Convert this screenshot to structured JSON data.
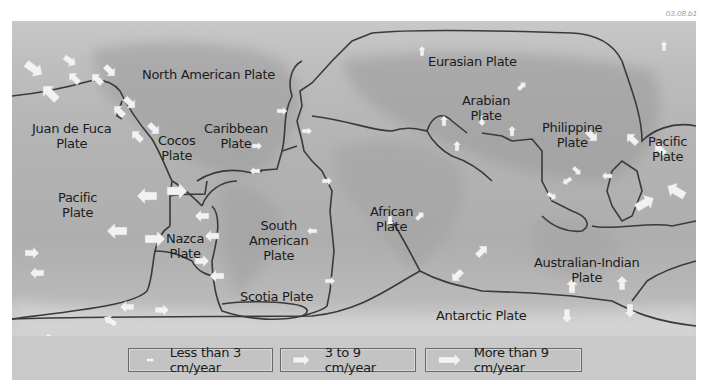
{
  "figure_code": "03.08.b1",
  "plates": [
    {
      "name": "north-american",
      "label": "North American Plate"
    },
    {
      "name": "eurasian",
      "label": "Eurasian Plate"
    },
    {
      "name": "arabian",
      "label": "Arabian Plate"
    },
    {
      "name": "juan-de-fuca",
      "label": "Juan de Fuca Plate"
    },
    {
      "name": "cocos",
      "label": "Cocos Plate"
    },
    {
      "name": "caribbean",
      "label": "Caribbean Plate"
    },
    {
      "name": "philippine",
      "label": "Philippine Plate"
    },
    {
      "name": "pacific-east",
      "label": "Pacific Plate"
    },
    {
      "name": "pacific-west",
      "label": "Pacific Plate"
    },
    {
      "name": "african",
      "label": "African Plate"
    },
    {
      "name": "nazca",
      "label": "Nazca Plate"
    },
    {
      "name": "south-american",
      "label": "South American Plate"
    },
    {
      "name": "australian-indian",
      "label": "Australian-Indian Plate"
    },
    {
      "name": "scotia",
      "label": "Scotia Plate"
    },
    {
      "name": "antarctic",
      "label": "Antarctic Plate"
    }
  ],
  "labels": {
    "north_american": "North American Plate",
    "eurasian": "Eurasian Plate",
    "arabian_1": "Arabian",
    "arabian_2": "Plate",
    "juan_1": "Juan de Fuca",
    "juan_2": "Plate",
    "cocos_1": "Cocos",
    "cocos_2": "Plate",
    "caribbean_1": "Caribbean",
    "caribbean_2": "Plate",
    "philippine_1": "Philippine",
    "philippine_2": "Plate",
    "pacific_e_1": "Pacific",
    "pacific_e_2": "Plate",
    "pacific_w_1": "Pacific",
    "pacific_w_2": "Plate",
    "african_1": "African",
    "african_2": "Plate",
    "nazca_1": "Nazca",
    "nazca_2": "Plate",
    "south_american_1": "South",
    "south_american_2": "American",
    "south_american_3": "Plate",
    "australian_1": "Australian-Indian",
    "australian_2": "Plate",
    "scotia": "Scotia Plate",
    "antarctic": "Antarctic Plate"
  },
  "legend": {
    "items": [
      {
        "icon": "small-arrow-icon",
        "label": "Less than 3 cm/year"
      },
      {
        "icon": "medium-arrow-icon",
        "label": "3 to 9 cm/year"
      },
      {
        "icon": "large-arrow-icon",
        "label": "More than 9 cm/year"
      }
    ]
  },
  "colors": {
    "boundary": "#3a3a3a",
    "arrow_fill": "#f2f2f2",
    "legend_bg": "#c3c3c3",
    "text": "#1c1c1c"
  }
}
